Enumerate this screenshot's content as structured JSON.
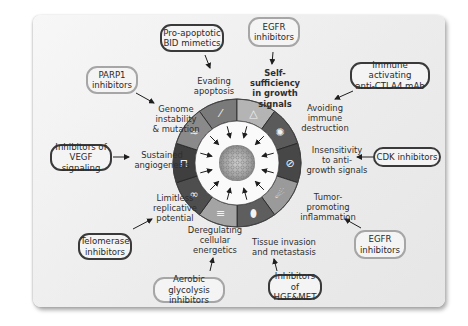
{
  "colors": {
    "card_bg": "#ececec",
    "ring_dark": "#4a4a4a",
    "ring_mid": "#6e6e6e",
    "ring_light": "#a8a8a8",
    "box_border_dark": "#3a3a3a",
    "box_border_light": "#a6a6a6",
    "arrow": "#1e1e1e"
  },
  "hallmarks": [
    {
      "id": "evading-apoptosis",
      "label": "Evading\napoptosis",
      "emphasis": false
    },
    {
      "id": "self-sufficiency",
      "label": "Self-sufficiency\nin growth\nsignals",
      "emphasis": true
    },
    {
      "id": "avoiding-immune",
      "label": "Avoiding\nimmune\ndestruction",
      "emphasis": false
    },
    {
      "id": "insensitivity",
      "label": "Insensitivity\nto anti-\ngrowth signals",
      "emphasis": false
    },
    {
      "id": "tumor-inflammation",
      "label": "Tumor-\npromoting\ninflammation",
      "emphasis": false
    },
    {
      "id": "invasion-metastasis",
      "label": "Tissue invasion\nand metastasis",
      "emphasis": false
    },
    {
      "id": "deregulating-energetics",
      "label": "Deregulating\ncellular\nenergetics",
      "emphasis": false
    },
    {
      "id": "replicative",
      "label": "Limitless\nreplicative\npotential",
      "emphasis": false
    },
    {
      "id": "angiogenesis",
      "label": "Sustained\nangiogenesis",
      "emphasis": false
    },
    {
      "id": "genome-instability",
      "label": "Genome\ninstability\n& mutation",
      "emphasis": false
    }
  ],
  "therapies": [
    {
      "id": "bid-mimetics",
      "label": "Pro-apoptotic\nBID mimetics",
      "style": "dark",
      "target": "evading-apoptosis"
    },
    {
      "id": "egfr-top",
      "label": "EGFR\ninhibitors",
      "style": "light",
      "target": "self-sufficiency"
    },
    {
      "id": "ctla4",
      "label": "Immune activating\nanti-CTLA4 mAb",
      "style": "dark",
      "target": "avoiding-immune"
    },
    {
      "id": "cdk",
      "label": "CDK inhibitors",
      "style": "dark",
      "target": "insensitivity"
    },
    {
      "id": "egfr-bottom",
      "label": "EGFR\ninhibitors",
      "style": "light",
      "target": "tumor-inflammation"
    },
    {
      "id": "hgf-met",
      "label": "Inhibitors of\nHGF&MET",
      "style": "dark",
      "target": "invasion-metastasis"
    },
    {
      "id": "glycolysis",
      "label": "Aerobic glycolysis\ninhibitors",
      "style": "light",
      "target": "deregulating-energetics"
    },
    {
      "id": "telomerase",
      "label": "Telomerase\ninhibitors",
      "style": "dark",
      "target": "replicative"
    },
    {
      "id": "vegf",
      "label": "Inhibitors of\nVEGF signaling",
      "style": "dark",
      "target": "angiogenesis"
    },
    {
      "id": "parp1",
      "label": "PARP1\ninhibitors",
      "style": "light",
      "target": "genome-instability"
    }
  ],
  "ring_segments": [
    {
      "icon": "dna-helix-icon",
      "tone": "#7a7a7a"
    },
    {
      "icon": "growth-signal-icon",
      "tone": "#b4b4b4"
    },
    {
      "icon": "immune-cell-icon",
      "tone": "#5a5a5a"
    },
    {
      "icon": "no-entry-icon",
      "tone": "#474747"
    },
    {
      "icon": "inflammation-icon",
      "tone": "#9a9a9a"
    },
    {
      "icon": "metastasis-cell-icon",
      "tone": "#5e5e5e"
    },
    {
      "icon": "mitochondria-icon",
      "tone": "#a4a4a4"
    },
    {
      "icon": "infinity-icon",
      "tone": "#4e4e4e"
    },
    {
      "icon": "blood-vessel-icon",
      "tone": "#3f3f3f"
    },
    {
      "icon": "chromosome-icon",
      "tone": "#8a8a8a"
    }
  ]
}
